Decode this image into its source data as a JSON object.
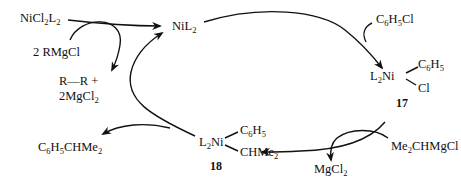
{
  "diagram": {
    "type": "catalytic-cycle",
    "species": {
      "precatalyst": {
        "main": "NiCl",
        "s1": "2",
        "mid": "L",
        "s2": "2"
      },
      "catalyst": {
        "main": "NiL",
        "s1": "2"
      },
      "reducing_reagent": "2 RMgCl",
      "reduction_byproduct_line1": "R—R +",
      "reduction_byproduct_line2": {
        "main": "2MgCl",
        "s1": "2"
      },
      "substrate": {
        "a": "C",
        "s1": "6",
        "b": "H",
        "s2": "5",
        "c": "Cl"
      },
      "intermediate_17": {
        "prefix": "L",
        "s1": "2",
        "metal": "Ni",
        "ligand_top": {
          "a": "C",
          "s1": "6",
          "b": "H",
          "s2": "5"
        },
        "ligand_bottom": "Cl",
        "number": "17"
      },
      "grignard": {
        "a": "Me",
        "s1": "2",
        "b": "CHMgCl"
      },
      "salt_byproduct": {
        "main": "MgCl",
        "s1": "2"
      },
      "intermediate_18": {
        "prefix": "L",
        "s1": "2",
        "metal": "Ni",
        "ligand_top": {
          "a": "C",
          "s1": "6",
          "b": "H",
          "s2": "5"
        },
        "ligand_bottom": {
          "a": "CHMe",
          "s1": "2"
        },
        "number": "18"
      },
      "product": {
        "a": "C",
        "s1": "6",
        "b": "H",
        "s2": "5",
        "c": "CHMe",
        "s3": "2"
      }
    },
    "colors": {
      "ink": "#111111",
      "background": "#ffffff"
    }
  }
}
